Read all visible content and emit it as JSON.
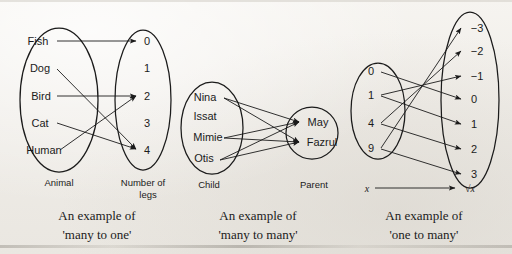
{
  "page": {
    "background_color": "#f2f0ec",
    "ink_color": "#1b1b1b",
    "bleed_through_text": "                                                  "
  },
  "diagrams": [
    {
      "id": "many-to-one",
      "caption_line1": "An example of",
      "caption_line2": "'many to one'",
      "domain": {
        "label": "Animal",
        "members": [
          "Fish",
          "Dog",
          "Bird",
          "Cat",
          "Human"
        ]
      },
      "codomain": {
        "label_line1": "Number of",
        "label_line2": "legs",
        "members": [
          "0",
          "1",
          "2",
          "3",
          "4"
        ]
      },
      "mappings": [
        {
          "from": "Fish",
          "to": "0"
        },
        {
          "from": "Dog",
          "to": "4"
        },
        {
          "from": "Bird",
          "to": "2"
        },
        {
          "from": "Cat",
          "to": "4"
        },
        {
          "from": "Human",
          "to": "2"
        }
      ]
    },
    {
      "id": "many-to-many",
      "caption_line1": "An example of",
      "caption_line2": "'many to many'",
      "domain": {
        "label": "Child",
        "members": [
          "Nina",
          "Issat",
          "Mimie",
          "Otis"
        ]
      },
      "codomain": {
        "label_line1": "Parent",
        "label_line2": "",
        "members": [
          "May",
          "Fazrul"
        ]
      },
      "mappings": [
        {
          "from": "Nina",
          "to": "May"
        },
        {
          "from": "Nina",
          "to": "Fazrul"
        },
        {
          "from": "Mimie",
          "to": "May"
        },
        {
          "from": "Mimie",
          "to": "Fazrul"
        },
        {
          "from": "Otis",
          "to": "May"
        },
        {
          "from": "Otis",
          "to": "Fazrul"
        }
      ]
    },
    {
      "id": "one-to-many",
      "caption_line1": "An example of",
      "caption_line2": "'one to many'",
      "domain": {
        "label": "x",
        "members": [
          "0",
          "1",
          "4",
          "9"
        ]
      },
      "codomain": {
        "label_line1": "√x",
        "label_line2": "",
        "members": [
          "−3",
          "−2",
          "−1",
          "0",
          "1",
          "2",
          "3"
        ]
      },
      "mappings": [
        {
          "from": "0",
          "to": "0"
        },
        {
          "from": "1",
          "to": "−1"
        },
        {
          "from": "1",
          "to": "1"
        },
        {
          "from": "4",
          "to": "−2"
        },
        {
          "from": "4",
          "to": "2"
        },
        {
          "from": "9",
          "to": "−3"
        },
        {
          "from": "9",
          "to": "3"
        }
      ]
    }
  ]
}
